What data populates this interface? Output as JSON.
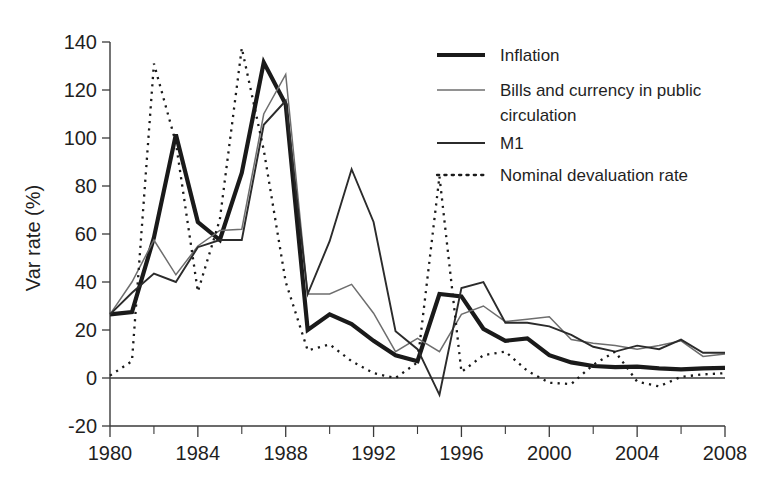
{
  "chart_data": {
    "type": "line",
    "title": "",
    "xlabel": "",
    "ylabel": "Var rate (%)",
    "xlim": [
      1980,
      2008
    ],
    "ylim": [
      -20,
      140
    ],
    "grid": false,
    "legend_position": "top-right",
    "x": [
      1980,
      1981,
      1982,
      1983,
      1984,
      1985,
      1986,
      1987,
      1988,
      1989,
      1990,
      1991,
      1992,
      1993,
      1994,
      1995,
      1996,
      1997,
      1998,
      1999,
      2000,
      2001,
      2002,
      2003,
      2004,
      2005,
      2006,
      2007,
      2008
    ],
    "xticks": [
      1980,
      1984,
      1988,
      1992,
      1996,
      2000,
      2004,
      2008
    ],
    "xticklabels": [
      "1980",
      "1984",
      "1988",
      "1992",
      "1996",
      "2000",
      "2004",
      "2008"
    ],
    "xminorticks": [
      1982,
      1986,
      1990,
      1994,
      1998,
      2002,
      2006
    ],
    "yticks": [
      -20,
      0,
      20,
      40,
      60,
      80,
      100,
      120,
      140
    ],
    "yticklabels": [
      "-20",
      "0",
      "20",
      "40",
      "60",
      "80",
      "100",
      "120",
      "140"
    ],
    "series": [
      {
        "name": "Inflation",
        "style": "solid-thick",
        "color": "#1a1a1a",
        "width": 4.2,
        "values": [
          26.5,
          27.5,
          58.5,
          101.5,
          65.0,
          57.5,
          85.5,
          131.5,
          114.0,
          20.0,
          26.5,
          22.5,
          15.5,
          9.5,
          7.0,
          35.0,
          34.0,
          20.5,
          15.5,
          16.5,
          9.5,
          6.5,
          5.0,
          4.5,
          4.7,
          4.0,
          3.6,
          4.0,
          4.2
        ]
      },
      {
        "name": "Bills and currency in public circulation",
        "style": "solid-thin-light",
        "color": "#6e6e6e",
        "width": 1.5,
        "values": [
          26.5,
          40.0,
          57.5,
          43.0,
          55.0,
          61.5,
          62.0,
          110.0,
          126.5,
          35.0,
          35.0,
          39.0,
          27.0,
          11.0,
          16.5,
          11.0,
          26.5,
          30.0,
          23.5,
          24.5,
          25.5,
          16.0,
          14.5,
          13.5,
          12.0,
          13.5,
          15.5,
          9.0,
          10.0
        ]
      },
      {
        "name": "M1",
        "style": "solid-medium",
        "color": "#2b2b2b",
        "width": 1.9,
        "values": [
          26.5,
          35.5,
          43.5,
          40.0,
          54.5,
          57.5,
          57.5,
          105.5,
          115.5,
          35.0,
          57.0,
          87.0,
          65.0,
          19.5,
          12.0,
          -7.0,
          37.5,
          40.0,
          23.0,
          23.0,
          21.5,
          18.0,
          13.0,
          11.0,
          13.5,
          12.0,
          16.0,
          10.5,
          10.5
        ]
      },
      {
        "name": "Nominal devaluation rate",
        "style": "dotted",
        "color": "#1a1a1a",
        "width": 2.3,
        "values": [
          1.0,
          7.0,
          131.0,
          98.0,
          36.0,
          66.0,
          137.5,
          95.0,
          40.0,
          11.5,
          14.0,
          7.0,
          2.0,
          0.0,
          6.5,
          84.0,
          2.5,
          9.5,
          11.0,
          3.0,
          -2.0,
          -2.5,
          5.5,
          11.0,
          -1.5,
          -3.5,
          0.5,
          1.5,
          2.0
        ]
      }
    ]
  },
  "legend": {
    "entries": [
      {
        "label": "Inflation",
        "style": "solid-thick"
      },
      {
        "label": "Bills and currency in public",
        "label2": "circulation",
        "style": "solid-thin-light"
      },
      {
        "label": "M1",
        "style": "solid-medium"
      },
      {
        "label": "Nominal devaluation rate",
        "style": "dotted"
      }
    ]
  }
}
